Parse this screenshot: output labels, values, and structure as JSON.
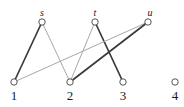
{
  "figure": {
    "background_color": "#ffffff",
    "width": 184,
    "height": 107
  },
  "style": {
    "node_stroke_color": "#555555",
    "node_fill_color": "#ffffff",
    "node_radius": 3.2,
    "node_stroke_width": 1,
    "edge_dark_color": "#3a3a3a",
    "edge_light_color": "#a8a8a8",
    "edge_dark_width": 1.7,
    "edge_light_width": 1.0,
    "label_color": "#1a1a1a"
  },
  "nodes": [
    {
      "id": "s",
      "label": "s",
      "row": "top",
      "x": 42,
      "y": 22,
      "label_x": 42,
      "label_y": 18,
      "label_style": "italic"
    },
    {
      "id": "t",
      "label": "t",
      "row": "top",
      "x": 95,
      "y": 22,
      "label_x": 95,
      "label_y": 18,
      "label_style": "italic"
    },
    {
      "id": "u",
      "label": "u",
      "row": "top",
      "x": 148,
      "y": 22,
      "label_x": 150,
      "label_y": 18,
      "label_style": "italic"
    },
    {
      "id": "1",
      "label": "1",
      "row": "bottom",
      "x": 14,
      "y": 82,
      "label_x": 14,
      "label_y": 89,
      "label_style": "upright"
    },
    {
      "id": "2",
      "label": "2",
      "row": "bottom",
      "x": 70,
      "y": 82,
      "label_x": 70,
      "label_y": 89,
      "label_style": "upright"
    },
    {
      "id": "3",
      "label": "3",
      "row": "bottom",
      "x": 123,
      "y": 82,
      "label_x": 123,
      "label_y": 89,
      "label_style": "upright"
    },
    {
      "id": "4",
      "label": "4",
      "row": "bottom",
      "x": 175,
      "y": 82,
      "label_x": 175,
      "label_y": 89,
      "label_style": "upright"
    }
  ],
  "edges": [
    {
      "id": "edge-s-1",
      "from": "s",
      "to": "1",
      "weight": "dark",
      "x1": 42,
      "y1": 22,
      "x2": 14,
      "y2": 82
    },
    {
      "id": "edge-s-2",
      "from": "s",
      "to": "2",
      "weight": "light",
      "x1": 42,
      "y1": 22,
      "x2": 70,
      "y2": 82
    },
    {
      "id": "edge-t-2",
      "from": "t",
      "to": "2",
      "weight": "light",
      "x1": 95,
      "y1": 22,
      "x2": 70,
      "y2": 82
    },
    {
      "id": "edge-t-3",
      "from": "t",
      "to": "3",
      "weight": "dark",
      "x1": 95,
      "y1": 22,
      "x2": 123,
      "y2": 82
    },
    {
      "id": "edge-u-1",
      "from": "u",
      "to": "1",
      "weight": "light",
      "x1": 148,
      "y1": 22,
      "x2": 14,
      "y2": 82
    },
    {
      "id": "edge-u-2",
      "from": "u",
      "to": "2",
      "weight": "dark",
      "x1": 148,
      "y1": 22,
      "x2": 70,
      "y2": 82
    }
  ],
  "isolated_nodes": [
    "4"
  ]
}
